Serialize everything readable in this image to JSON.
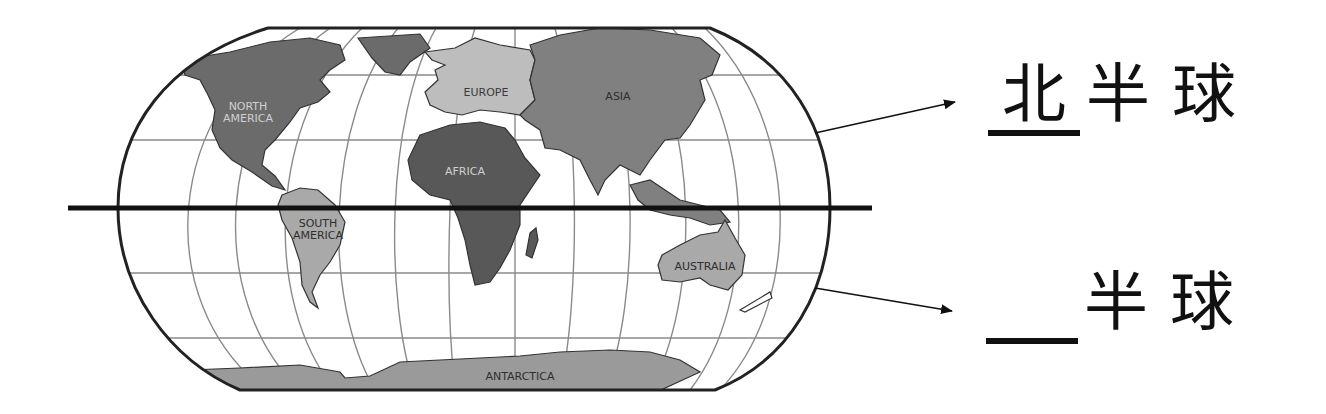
{
  "diagram": {
    "type": "world-map-hemispheres",
    "map": {
      "continents": [
        {
          "name": "NORTH AMERICA",
          "line1": "NORTH",
          "line2": "AMERICA",
          "fill": "#6b6b6b",
          "label_color": "#d0d0d0"
        },
        {
          "name": "EUROPE",
          "line1": "EUROPE",
          "fill": "#bdbdbd",
          "label_color": "#3a3a3a"
        },
        {
          "name": "ASIA",
          "line1": "ASIA",
          "fill": "#808080",
          "label_color": "#2e2e2e"
        },
        {
          "name": "AFRICA",
          "line1": "AFRICA",
          "fill": "#585858",
          "label_color": "#cfcfcf"
        },
        {
          "name": "SOUTH AMERICA",
          "line1": "SOUTH",
          "line2": "AMERICA",
          "fill": "#a9a9a9",
          "label_color": "#2e2e2e"
        },
        {
          "name": "AUSTRALIA",
          "line1": "AUSTRALIA",
          "fill": "#a9a9a9",
          "label_color": "#2e2e2e"
        },
        {
          "name": "ANTARCTICA",
          "line1": "ANTARCTICA",
          "fill": "#9a9a9a",
          "label_color": "#2e2e2e"
        }
      ],
      "equator_color": "#111111",
      "grid_color": "#8a8a8a",
      "outline_color": "#222222"
    },
    "labels": {
      "northern": {
        "blank_answer": "北",
        "suffix": "半球"
      },
      "southern": {
        "blank_answer": "",
        "suffix": "半球"
      }
    }
  }
}
